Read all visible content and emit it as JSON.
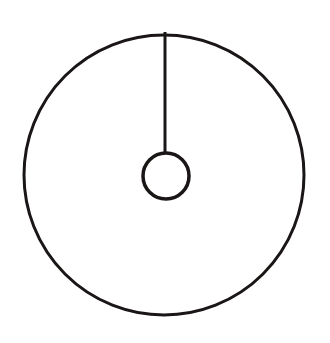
{
  "diagram": {
    "background": "#ffffff",
    "stroke_color": "#1a1616",
    "outer_circle": {
      "cx": 164,
      "cy": 175,
      "r": 140,
      "stroke_width": 3
    },
    "inner_circle": {
      "cx": 166,
      "cy": 176,
      "r": 23,
      "stroke_width": 3.5
    },
    "radius_line": {
      "x": 165,
      "y1": 32,
      "y2": 153,
      "stroke_width": 3
    }
  }
}
